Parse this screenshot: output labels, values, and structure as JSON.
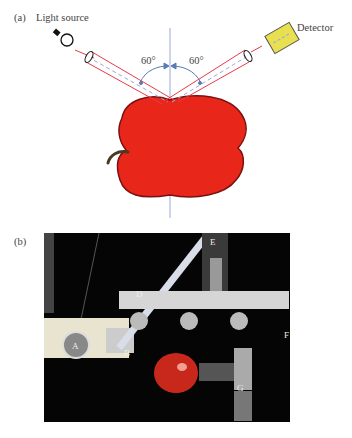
{
  "panel_a": {
    "label": "(a)",
    "light_source_label": "Light source",
    "detector_label": "Detector",
    "angle_left": "60°",
    "angle_right": "60°",
    "colors": {
      "beam": "#e83a4a",
      "normal_line": "#9aaad8",
      "angle_arc": "#5a7ab8",
      "apple": "#e8261a",
      "apple_outline": "#7a1010",
      "stem": "#4a3a22",
      "detector": "#e8e050"
    }
  },
  "panel_b": {
    "label": "(b)",
    "photo_labels": [
      "A",
      "B",
      "D",
      "E",
      "F",
      "G"
    ]
  }
}
